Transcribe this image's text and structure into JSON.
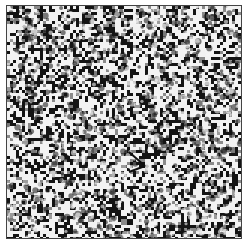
{
  "image": {
    "kind": "random-dot noise texture",
    "width": 247,
    "height": 245,
    "frame": {
      "x": 6,
      "y": 5,
      "w": 236,
      "h": 234,
      "border_color": "#444444"
    },
    "texture": {
      "seed": 1337,
      "cell_px": 3,
      "base_dark_probability": 0.45,
      "dense_region": {
        "cx": 135,
        "cy": 140,
        "radius": 45,
        "extra_dark": 0.2
      },
      "dark_color": "#141414",
      "mid_color": "#8a8a8a",
      "light_color": "#f2f2f2"
    },
    "marker": {
      "type": "arrow",
      "x": 118,
      "y": 140,
      "color": "#111111"
    }
  }
}
